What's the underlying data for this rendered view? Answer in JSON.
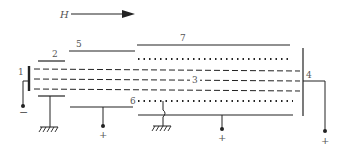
{
  "diagram": {
    "field_label": "H",
    "labels": {
      "l1": "1",
      "l2": "2",
      "l3": "3",
      "l4": "4",
      "l5": "5",
      "l6": "6",
      "l7": "7"
    },
    "polarity": {
      "cathode": "−",
      "plate6_terminal": "+",
      "plate_bottom_terminal": "+",
      "collector_terminal": "+"
    },
    "colors": {
      "line": "#222222",
      "label": "#555555"
    }
  }
}
